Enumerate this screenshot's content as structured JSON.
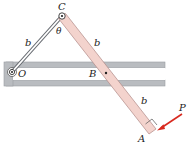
{
  "diagram": {
    "labels": {
      "C": "C",
      "O": "O",
      "B": "B",
      "A": "A",
      "P": "P",
      "theta": "θ",
      "b_oc": "b",
      "b_cb": "b",
      "b_ba": "b"
    },
    "colors": {
      "bar_fill": "#f3d3cd",
      "bar_stroke": "#b08a86",
      "guide_fill": "#b9bcc0",
      "guide_shadow": "#9a9da2",
      "force_arrow": "#d8291f",
      "link_stroke": "#6a6e74"
    }
  }
}
